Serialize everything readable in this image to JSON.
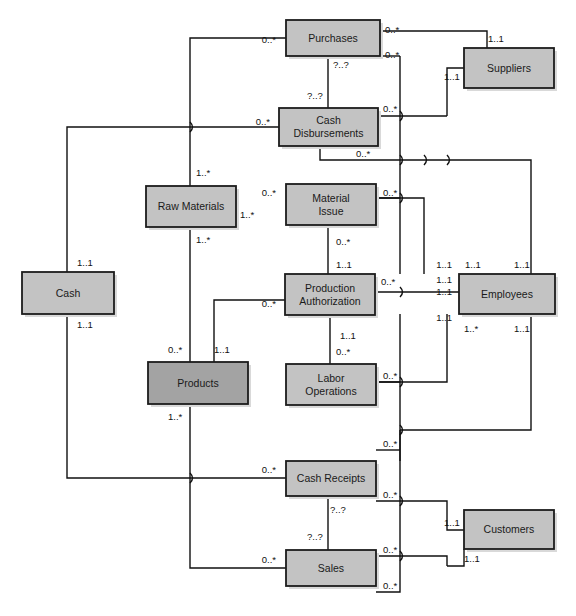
{
  "diagram": {
    "type": "entity-relationship-diagram",
    "canvas": {
      "width": 576,
      "height": 616
    },
    "colors": {
      "entity_fill": "#c3c3c3",
      "entity_fill_highlight": "#a3a3a3",
      "entity_stroke": "#1c1c1c",
      "line": "#111111",
      "shadow": "#d9d9d9",
      "background": "#ffffff"
    },
    "entities": [
      {
        "id": "purchases",
        "label": "Purchases",
        "lines": [
          "Purchases"
        ],
        "x": 286,
        "y": 20,
        "w": 94,
        "h": 36,
        "highlight": false
      },
      {
        "id": "suppliers",
        "label": "Suppliers",
        "lines": [
          "Suppliers"
        ],
        "x": 464,
        "y": 48,
        "w": 90,
        "h": 40,
        "highlight": false
      },
      {
        "id": "cash_disb",
        "label": "Cash Disbursements",
        "lines": [
          "Cash",
          "Disbursements"
        ],
        "x": 279,
        "y": 108,
        "w": 99,
        "h": 38,
        "highlight": false
      },
      {
        "id": "raw_materials",
        "label": "Raw Materials",
        "lines": [
          "Raw Materials"
        ],
        "x": 146,
        "y": 186,
        "w": 90,
        "h": 41,
        "highlight": false
      },
      {
        "id": "material_issue",
        "label": "Material Issue",
        "lines": [
          "Material",
          "Issue"
        ],
        "x": 286,
        "y": 184,
        "w": 90,
        "h": 41,
        "highlight": false
      },
      {
        "id": "cash",
        "label": "Cash",
        "lines": [
          "Cash"
        ],
        "x": 22,
        "y": 272,
        "w": 92,
        "h": 42,
        "highlight": false
      },
      {
        "id": "prod_auth",
        "label": "Production Authorization",
        "lines": [
          "Production",
          "Authorization"
        ],
        "x": 285,
        "y": 274,
        "w": 90,
        "h": 41,
        "highlight": false
      },
      {
        "id": "employees",
        "label": "Employees",
        "lines": [
          "Employees"
        ],
        "x": 459,
        "y": 274,
        "w": 96,
        "h": 40,
        "highlight": false
      },
      {
        "id": "products",
        "label": "Products",
        "lines": [
          "Products"
        ],
        "x": 148,
        "y": 362,
        "w": 100,
        "h": 42,
        "highlight": true
      },
      {
        "id": "labor_ops",
        "label": "Labor Operations",
        "lines": [
          "Labor",
          "Operations"
        ],
        "x": 286,
        "y": 364,
        "w": 90,
        "h": 41,
        "highlight": false
      },
      {
        "id": "cash_receipts",
        "label": "Cash Receipts",
        "lines": [
          "Cash Receipts"
        ],
        "x": 286,
        "y": 461,
        "w": 90,
        "h": 35,
        "highlight": false
      },
      {
        "id": "customers",
        "label": "Customers",
        "lines": [
          "Customers"
        ],
        "x": 464,
        "y": 510,
        "w": 90,
        "h": 39,
        "highlight": false
      },
      {
        "id": "sales",
        "label": "Sales",
        "lines": [
          "Sales"
        ],
        "x": 286,
        "y": 550,
        "w": 90,
        "h": 36,
        "highlight": false
      }
    ],
    "cardinalities": [
      {
        "id": "c01",
        "text": "0..*",
        "x": 276,
        "y": 43,
        "anchor": "end",
        "rel": "purchases-rawmaterials"
      },
      {
        "id": "c02",
        "text": "0..*",
        "x": 385,
        "y": 33,
        "anchor": "start",
        "rel": "purchases-suppliers"
      },
      {
        "id": "c03",
        "text": "1..1",
        "x": 488,
        "y": 42,
        "anchor": "start",
        "rel": "suppliers-purchases"
      },
      {
        "id": "c04",
        "text": "0..*",
        "x": 385,
        "y": 58,
        "anchor": "start",
        "rel": "purchases-employees"
      },
      {
        "id": "c05",
        "text": "1..1",
        "x": 444,
        "y": 80,
        "anchor": "start",
        "rel": "suppliers-cashdisb"
      },
      {
        "id": "c06",
        "text": "?..?",
        "x": 333,
        "y": 68,
        "anchor": "start",
        "rel": "purchases-cashdisb-upper"
      },
      {
        "id": "c07",
        "text": "?..?",
        "x": 307,
        "y": 99,
        "anchor": "start",
        "rel": "purchases-cashdisb-lower"
      },
      {
        "id": "c08",
        "text": "0..*",
        "x": 270,
        "y": 125,
        "anchor": "end",
        "rel": "cashdisb-cash"
      },
      {
        "id": "c09",
        "text": "0..*",
        "x": 383,
        "y": 112,
        "anchor": "start",
        "rel": "cashdisb-suppliers"
      },
      {
        "id": "c10",
        "text": "0..*",
        "x": 356,
        "y": 157,
        "anchor": "start",
        "rel": "cashdisb-employees"
      },
      {
        "id": "c11",
        "text": "1..*",
        "x": 196,
        "y": 176,
        "anchor": "start",
        "rel": "rawmaterials-purchases"
      },
      {
        "id": "c12",
        "text": "0..*",
        "x": 276,
        "y": 196,
        "anchor": "end",
        "rel": "materialissue-rawmaterials"
      },
      {
        "id": "c13",
        "text": "1..*",
        "x": 240,
        "y": 218,
        "anchor": "start",
        "rel": "rawmaterials-materialissue"
      },
      {
        "id": "c14",
        "text": "0..*",
        "x": 383,
        "y": 196,
        "anchor": "start",
        "rel": "materialissue-employees"
      },
      {
        "id": "c15",
        "text": "1..*",
        "x": 196,
        "y": 243,
        "anchor": "start",
        "rel": "rawmaterials-products"
      },
      {
        "id": "c16",
        "text": "0..*",
        "x": 336,
        "y": 245,
        "anchor": "start",
        "rel": "materialissue-prodauth"
      },
      {
        "id": "c17",
        "text": "1..1",
        "x": 77,
        "y": 266,
        "anchor": "start",
        "rel": "cash-cashdisb"
      },
      {
        "id": "c18",
        "text": "1..1",
        "x": 77,
        "y": 328,
        "anchor": "start",
        "rel": "cash-cashreceipts"
      },
      {
        "id": "c19",
        "text": "1..1",
        "x": 336,
        "y": 268,
        "anchor": "start",
        "rel": "prodauth-materialissue"
      },
      {
        "id": "c20",
        "text": "0..*",
        "x": 381,
        "y": 285,
        "anchor": "start",
        "rel": "prodauth-employees"
      },
      {
        "id": "c21",
        "text": "0..*",
        "x": 276,
        "y": 307,
        "anchor": "end",
        "rel": "prodauth-products"
      },
      {
        "id": "c22",
        "text": "1..1",
        "x": 452,
        "y": 268,
        "anchor": "end",
        "rel": "employees-materialissue"
      },
      {
        "id": "c23",
        "text": "1..1",
        "x": 452,
        "y": 283,
        "anchor": "end",
        "rel": "employees-cashdisb"
      },
      {
        "id": "c24",
        "text": "1..1",
        "x": 452,
        "y": 295,
        "anchor": "end",
        "rel": "employees-prodauth"
      },
      {
        "id": "c25",
        "text": "1..1",
        "x": 452,
        "y": 321,
        "anchor": "end",
        "rel": "employees-laborops"
      },
      {
        "id": "c26",
        "text": "1..1",
        "x": 465,
        "y": 268,
        "anchor": "start",
        "rel": "employees-purchases"
      },
      {
        "id": "c27",
        "text": "1..1",
        "x": 514,
        "y": 268,
        "anchor": "start",
        "rel": "employees-cashdisb2"
      },
      {
        "id": "c28",
        "text": "1..*",
        "x": 464,
        "y": 332,
        "anchor": "start",
        "rel": "employees-cashreceipts"
      },
      {
        "id": "c29",
        "text": "1..1",
        "x": 514,
        "y": 332,
        "anchor": "start",
        "rel": "employees-sales"
      },
      {
        "id": "c30",
        "text": "1..1",
        "x": 340,
        "y": 339,
        "anchor": "start",
        "rel": "prodauth-laborops"
      },
      {
        "id": "c31",
        "text": "0..*",
        "x": 168,
        "y": 353,
        "anchor": "start",
        "rel": "products-rawmaterials"
      },
      {
        "id": "c32",
        "text": "1..1",
        "x": 214,
        "y": 353,
        "anchor": "start",
        "rel": "products-prodauth"
      },
      {
        "id": "c33",
        "text": "0..*",
        "x": 336,
        "y": 355,
        "anchor": "start",
        "rel": "laborops-prodauth"
      },
      {
        "id": "c34",
        "text": "0..*",
        "x": 383,
        "y": 379,
        "anchor": "start",
        "rel": "laborops-employees"
      },
      {
        "id": "c35",
        "text": "1..*",
        "x": 168,
        "y": 420,
        "anchor": "start",
        "rel": "products-sales"
      },
      {
        "id": "c36",
        "text": "0..*",
        "x": 383,
        "y": 447,
        "anchor": "start",
        "rel": "cashreceipts-employees"
      },
      {
        "id": "c37",
        "text": "0..*",
        "x": 276,
        "y": 473,
        "anchor": "end",
        "rel": "cashreceipts-cash"
      },
      {
        "id": "c38",
        "text": "0..*",
        "x": 383,
        "y": 498,
        "anchor": "start",
        "rel": "cashreceipts-customers"
      },
      {
        "id": "c39",
        "text": "?..?",
        "x": 330,
        "y": 513,
        "anchor": "start",
        "rel": "cashreceipts-sales-upper"
      },
      {
        "id": "c40",
        "text": "?..?",
        "x": 307,
        "y": 540,
        "anchor": "start",
        "rel": "cashreceipts-sales-lower"
      },
      {
        "id": "c41",
        "text": "1..1",
        "x": 444,
        "y": 526,
        "anchor": "start",
        "rel": "customers-cashreceipts"
      },
      {
        "id": "c42",
        "text": "0..*",
        "x": 276,
        "y": 563,
        "anchor": "end",
        "rel": "sales-products"
      },
      {
        "id": "c43",
        "text": "0..*",
        "x": 383,
        "y": 553,
        "anchor": "start",
        "rel": "sales-customers"
      },
      {
        "id": "c44",
        "text": "0..*",
        "x": 383,
        "y": 589,
        "anchor": "start",
        "rel": "sales-employees"
      },
      {
        "id": "c45",
        "text": "1..1",
        "x": 464,
        "y": 562,
        "anchor": "start",
        "rel": "customers-sales"
      }
    ]
  }
}
